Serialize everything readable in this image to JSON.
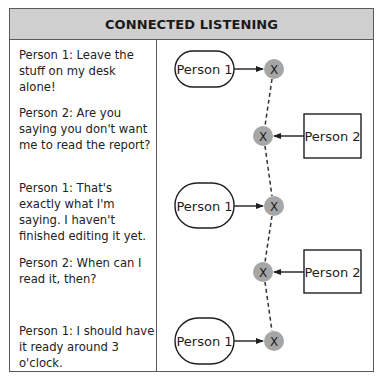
{
  "title": "CONNECTED LISTENING",
  "dialogue": [
    {
      "speaker": "Person 1",
      "text": "Person 1: Leave the stuff on my desk alone!"
    },
    {
      "speaker": "Person 2",
      "text": "Person 2: Are you saying you don't want me to read the report?"
    },
    {
      "speaker": "Person 1",
      "text": "Person 1: That's exactly what I'm saying. I haven't finished editing it yet."
    },
    {
      "speaker": "Person 2",
      "text": "Person 2: When can I read it, then?"
    },
    {
      "speaker": "Person 1",
      "text": "Person 1: I should have it ready around 3 o'clock."
    }
  ],
  "diagram": {
    "person1_label": "Person 1",
    "person2_label": "Person 2",
    "node_label": "X",
    "node_color": "#a6a6a6",
    "header_color": "#cfcfcf",
    "nodes": [
      {
        "speaker": "Person 1",
        "shape": "rounded",
        "label": "Person 1"
      },
      {
        "speaker": "Person 2",
        "shape": "rectangle",
        "label": "Person 2"
      },
      {
        "speaker": "Person 1",
        "shape": "rounded",
        "label": "Person 1"
      },
      {
        "speaker": "Person 2",
        "shape": "rectangle",
        "label": "Person 2"
      },
      {
        "speaker": "Person 1",
        "shape": "rounded",
        "label": "Person 1"
      }
    ],
    "connector": "dashed"
  }
}
